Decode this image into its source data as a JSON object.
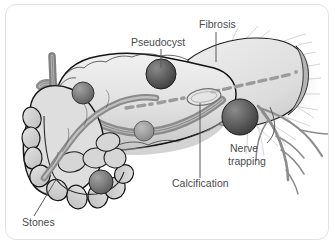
{
  "figure": {
    "style": "grayscale medical line drawing",
    "border_color": "#e2e2e4",
    "background_color": "#ffffff"
  },
  "palette": {
    "outline": "#1a1a1a",
    "organ_light": "#e9e9e9",
    "organ_mid": "#cfcfcf",
    "organ_shadow": "#9a9a9a",
    "duct_gray": "#a8a8a8",
    "sphere_dark": "#4a4a4a",
    "sphere_light": "#8d8d8d",
    "text_gray": "#4c4c4e",
    "leader_gray": "#58585a",
    "fibrosis_gray": "#bdbdbd",
    "nerve_gray": "#8f8f91"
  },
  "labels": [
    {
      "id": "pseudocyst",
      "text": "Pseudocyst",
      "x": 131,
      "y": 46,
      "anchor": "start",
      "leader": "M161,49 L161,68"
    },
    {
      "id": "fibrosis",
      "text": "Fibrosis",
      "x": 199,
      "y": 28,
      "anchor": "start",
      "leader": "M216,32 L216,62"
    },
    {
      "id": "nerve_trapping_line1",
      "text": "Nerve",
      "x": 230,
      "y": 152,
      "anchor": "start",
      "leader": "M267,143 C275,136 276,126 270,108"
    },
    {
      "id": "nerve_trapping_line2",
      "text": "trapping",
      "x": 228,
      "y": 165,
      "anchor": "start",
      "leader": ""
    },
    {
      "id": "calcification",
      "text": "Calcification",
      "x": 172,
      "y": 187,
      "anchor": "start",
      "leader": "M200,178 L200,103"
    },
    {
      "id": "stones",
      "text": "Stones",
      "x": 22,
      "y": 226,
      "anchor": "start",
      "leader": "M34,216 L57,178"
    }
  ],
  "anatomy": {
    "structures": [
      "pancreas-body",
      "pancreas-tail",
      "pancreas-head",
      "duodenum-loop",
      "common-bile-duct",
      "pancreatic-duct-dashed",
      "splenic-vessel"
    ],
    "lesions": [
      {
        "name": "pseudocyst-main",
        "cx": 161,
        "cy": 74,
        "r": 15,
        "tone": "dark"
      },
      {
        "name": "pseudocyst-upper-left",
        "cx": 83,
        "cy": 93,
        "r": 11,
        "tone": "mid"
      },
      {
        "name": "pseudocyst-mid",
        "cx": 144,
        "cy": 131,
        "r": 10,
        "tone": "light"
      },
      {
        "name": "pseudocyst-right",
        "cx": 240,
        "cy": 117,
        "r": 18,
        "tone": "dark"
      },
      {
        "name": "stone-large",
        "cx": 101,
        "cy": 182,
        "r": 12,
        "tone": "mid"
      }
    ],
    "calcification_outline": {
      "cx": 204,
      "cy": 97,
      "rx": 17,
      "ry": 8,
      "rotation": -8
    },
    "fibrosis_streaks_count": 18,
    "nerve_branches_count": 7
  }
}
